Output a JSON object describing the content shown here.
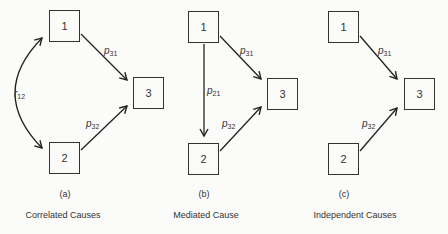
{
  "panels": [
    {
      "id": "a",
      "letter": "(a)",
      "caption": "Correlated Causes",
      "nodes": {
        "n1": "1",
        "n2": "2",
        "n3": "3"
      },
      "edges": {
        "r12": {
          "sym": "r",
          "sub": "12",
          "type": "bidirectional-curve",
          "from": "1",
          "to": "2"
        },
        "p31": {
          "sym": "p",
          "sub": "31",
          "from": "1",
          "to": "3"
        },
        "p32": {
          "sym": "p",
          "sub": "32",
          "from": "2",
          "to": "3"
        }
      }
    },
    {
      "id": "b",
      "letter": "(b)",
      "caption": "Mediated Cause",
      "nodes": {
        "n1": "1",
        "n2": "2",
        "n3": "3"
      },
      "edges": {
        "p21": {
          "sym": "p",
          "sub": "21",
          "from": "1",
          "to": "2"
        },
        "p31": {
          "sym": "p",
          "sub": "31",
          "from": "1",
          "to": "3"
        },
        "p32": {
          "sym": "p",
          "sub": "32",
          "from": "2",
          "to": "3"
        }
      }
    },
    {
      "id": "c",
      "letter": "(c)",
      "caption": "Independent Causes",
      "nodes": {
        "n1": "1",
        "n2": "2",
        "n3": "3"
      },
      "edges": {
        "p31": {
          "sym": "p",
          "sub": "31",
          "from": "1",
          "to": "3"
        },
        "p32": {
          "sym": "p",
          "sub": "32",
          "from": "2",
          "to": "3"
        }
      }
    }
  ]
}
